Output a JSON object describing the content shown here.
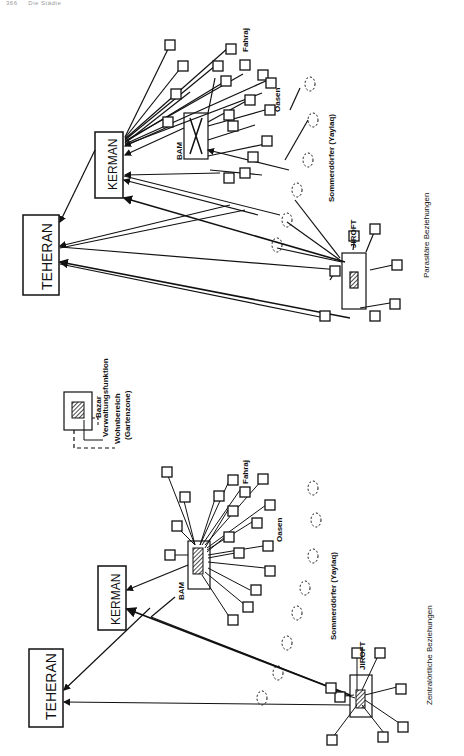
{
  "header": {
    "page_number": "366",
    "running_title": "Die Städte"
  },
  "legend": {
    "items": [
      "Bazar",
      "Verwaltungsfunktion",
      "Wohnbereich",
      "(Gartenzone)"
    ]
  },
  "panel_bottom": {
    "caption": "Zentralörtliche Beziehungen",
    "cities": {
      "teheran": "TEHERAN",
      "kerman": "KERMAN",
      "bam": "BAM",
      "jiroft": "JIROFT"
    },
    "labels": {
      "fahraj": "Fahraj",
      "oasen": "Oasen",
      "sommerdoerfer": "Sommerdörfer (Yaylaq)"
    }
  },
  "panel_top": {
    "caption": "Parasitäre Beziehungen",
    "cities": {
      "teheran": "TEHERAN",
      "kerman": "KERMAN",
      "bam": "BAM",
      "jiroft": "JIROFT"
    },
    "labels": {
      "fahraj": "Fahraj",
      "oasen": "Oasen",
      "sommerdoerfer": "Sommerdörfer (Yaylaq)"
    }
  }
}
